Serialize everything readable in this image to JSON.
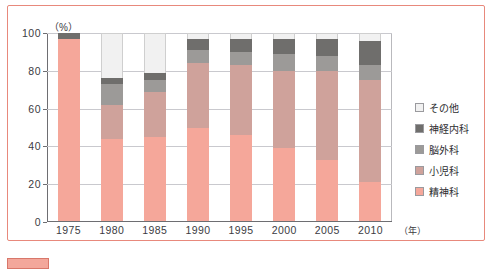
{
  "chart_data": {
    "type": "bar",
    "stacked": true,
    "title": "",
    "xlabel": "年",
    "ylabel": "(%)",
    "ylim": [
      0,
      100
    ],
    "yticks": [
      0,
      20,
      40,
      60,
      80,
      100
    ],
    "grid": true,
    "legend_position": "right",
    "categories": [
      "1975",
      "1980",
      "1985",
      "1990",
      "1995",
      "2000",
      "2005",
      "2010"
    ],
    "series": [
      {
        "name": "精神科",
        "key": "psy",
        "color": "#f5a79a",
        "values": [
          97,
          44,
          45,
          50,
          46,
          39,
          33,
          21
        ]
      },
      {
        "name": "小児科",
        "key": "ped",
        "color": "#cfa29b",
        "values": [
          0,
          18,
          24,
          34,
          37,
          41,
          47,
          54
        ]
      },
      {
        "name": "脳外科",
        "key": "nsu",
        "color": "#9c9a98",
        "values": [
          0,
          11,
          6,
          7,
          7,
          9,
          8,
          8
        ]
      },
      {
        "name": "神経内科",
        "key": "neu",
        "color": "#6f6e6c",
        "values": [
          3,
          3,
          4,
          6,
          7,
          8,
          9,
          13
        ]
      },
      {
        "name": "その他",
        "key": "oth",
        "color": "#f1f1f1",
        "values": [
          0,
          24,
          21,
          3,
          3,
          3,
          3,
          4
        ]
      }
    ]
  },
  "legend": {
    "items": [
      {
        "label": "その他",
        "color": "#f1f1f1"
      },
      {
        "label": "神経内科",
        "color": "#6f6e6c"
      },
      {
        "label": "脳外科",
        "color": "#9c9a98"
      },
      {
        "label": "小児科",
        "color": "#cfa29b"
      },
      {
        "label": "精神科",
        "color": "#f5a79a"
      }
    ]
  },
  "axes": {
    "y_unit": "（%）",
    "x_unit": "（年）"
  },
  "caption": {
    "text": ""
  },
  "colors": {
    "frame": "#e8897c",
    "grid": "#c9c9ce",
    "axis": "#6e6e72"
  }
}
